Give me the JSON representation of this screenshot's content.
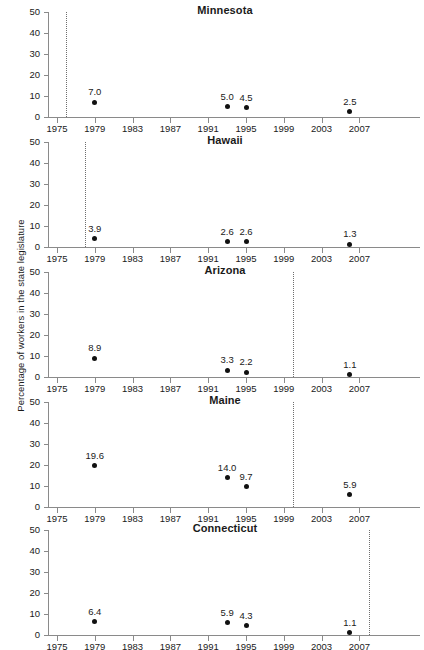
{
  "chart_data": {
    "type": "scatter",
    "title": "",
    "ylabel": "Percentage of workers in the state legislature",
    "xlabel": "",
    "ylim": [
      0,
      50
    ],
    "xlim": [
      1974,
      2009
    ],
    "yticks": [
      0,
      10,
      20,
      30,
      40,
      50
    ],
    "xticks": [
      1975,
      1979,
      1983,
      1987,
      1991,
      1995,
      1999,
      2003,
      2007
    ],
    "grid": false,
    "legend": null,
    "panels": [
      {
        "name": "Minnesota",
        "reference_line_year": 1976,
        "points": [
          {
            "x": 1979,
            "y": 7.0,
            "label": "7.0"
          },
          {
            "x": 1993,
            "y": 5.0,
            "label": "5.0"
          },
          {
            "x": 1995,
            "y": 4.5,
            "label": "4.5"
          },
          {
            "x": 2006,
            "y": 2.5,
            "label": "2.5"
          }
        ]
      },
      {
        "name": "Hawaii",
        "reference_line_year": 1978,
        "points": [
          {
            "x": 1979,
            "y": 3.9,
            "label": "3.9"
          },
          {
            "x": 1993,
            "y": 2.6,
            "label": "2.6"
          },
          {
            "x": 1995,
            "y": 2.6,
            "label": "2.6"
          },
          {
            "x": 2006,
            "y": 1.3,
            "label": "1.3"
          }
        ]
      },
      {
        "name": "Arizona",
        "reference_line_year": 2000,
        "points": [
          {
            "x": 1979,
            "y": 8.9,
            "label": "8.9"
          },
          {
            "x": 1993,
            "y": 3.3,
            "label": "3.3"
          },
          {
            "x": 1995,
            "y": 2.2,
            "label": "2.2"
          },
          {
            "x": 2006,
            "y": 1.1,
            "label": "1.1"
          }
        ]
      },
      {
        "name": "Maine",
        "reference_line_year": 2000,
        "points": [
          {
            "x": 1979,
            "y": 19.6,
            "label": "19.6"
          },
          {
            "x": 1993,
            "y": 14.0,
            "label": "14.0"
          },
          {
            "x": 1995,
            "y": 9.7,
            "label": "9.7"
          },
          {
            "x": 2006,
            "y": 5.9,
            "label": "5.9"
          }
        ]
      },
      {
        "name": "Connecticut",
        "reference_line_year": 2008,
        "points": [
          {
            "x": 1979,
            "y": 6.4,
            "label": "6.4"
          },
          {
            "x": 1993,
            "y": 5.9,
            "label": "5.9"
          },
          {
            "x": 1995,
            "y": 4.3,
            "label": "4.3"
          },
          {
            "x": 2006,
            "y": 1.1,
            "label": "1.1"
          }
        ]
      }
    ]
  },
  "colors": {
    "marker": "#111111",
    "axis": "#8a8a8a",
    "reference_line": "#6e6e6e",
    "text": "#1a1a1a",
    "background": "#ffffff"
  }
}
